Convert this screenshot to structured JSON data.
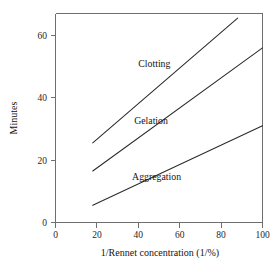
{
  "chart_data": {
    "type": "line",
    "title": "",
    "xlabel": "1/Rennet concentration (1/%)",
    "ylabel": "Minutes",
    "xlim": [
      0,
      100
    ],
    "ylim": [
      0,
      67
    ],
    "grid": false,
    "legend_position": "inline-labels",
    "xticks": [
      0,
      20,
      40,
      60,
      80,
      100
    ],
    "xtick_labels": [
      "0",
      "20",
      "40",
      "60",
      "80",
      "100"
    ],
    "yticks": [
      0,
      20,
      40,
      60
    ],
    "ytick_labels": [
      "0",
      "20",
      "40",
      "60"
    ],
    "series": [
      {
        "name": "Clotting",
        "x": [
          18,
          88
        ],
        "values": [
          25.5,
          65.5
        ],
        "label": "Clotting",
        "label_x": 40,
        "label_y": 50
      },
      {
        "name": "Gelation",
        "x": [
          18,
          100
        ],
        "values": [
          16.5,
          56
        ],
        "label": "Gelation",
        "label_x": 38,
        "label_y": 31.5
      },
      {
        "name": "Aggregation",
        "x": [
          18,
          100
        ],
        "values": [
          5.5,
          31
        ],
        "label": "Aggregation",
        "label_x": 37,
        "label_y": 13.5
      }
    ]
  },
  "axis_tick_labels": {
    "y_60": "60",
    "y_40": "40",
    "y_20": "20",
    "y_0": "0",
    "x_0": "0",
    "x_20": "20",
    "x_40": "40",
    "x_60": "60",
    "x_80": "80",
    "x_100": "100"
  },
  "axis_titles": {
    "x": "1/Rennet concentration (1/%)",
    "y": "Minutes"
  },
  "series_labels": {
    "clotting": "Clotting",
    "gelation": "Gelation",
    "aggregation": "Aggregation"
  },
  "colors": {
    "line": "#2b2b2b",
    "axis": "#6e6e6e",
    "text": "#141414",
    "background": "#ffffff"
  }
}
